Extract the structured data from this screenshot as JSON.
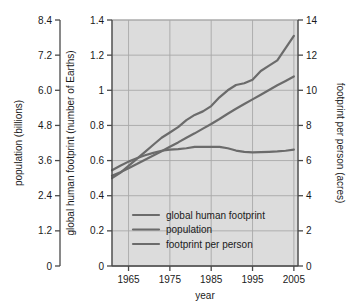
{
  "chart_data": {
    "type": "line",
    "title": "",
    "xlabel": "year",
    "x": [
      1961,
      1963,
      1965,
      1967,
      1969,
      1971,
      1973,
      1975,
      1977,
      1979,
      1981,
      1983,
      1985,
      1987,
      1989,
      1991,
      1993,
      1995,
      1997,
      1999,
      2001,
      2003,
      2005
    ],
    "xlim": [
      1961,
      2006
    ],
    "xticks": [
      1965,
      1975,
      1985,
      1995,
      2005
    ],
    "xtick_labels": [
      "1965",
      "1975",
      "1985",
      "1995",
      "2005"
    ],
    "grid": true,
    "legend_position": "bottom-center-inside",
    "axes": [
      {
        "id": "left",
        "label": "population (billions)",
        "lim": [
          0,
          8.4
        ],
        "ticks": [
          0,
          1.2,
          2.4,
          3.6,
          4.8,
          6.0,
          7.2,
          8.4
        ],
        "tick_labels": [
          "0",
          "1.2",
          "2.4",
          "3.6",
          "4.8",
          "6.0",
          "7.2",
          "8.4"
        ]
      },
      {
        "id": "inner-left",
        "label": "global human footprint (number of Earths)",
        "lim": [
          0,
          1.4
        ],
        "ticks": [
          0,
          0.2,
          0.4,
          0.6,
          0.8,
          1.0,
          1.2,
          1.4
        ],
        "tick_labels": [
          "0",
          "0.2",
          "0.4",
          "0.6",
          "0.8",
          "1",
          "1.2",
          "1.4"
        ]
      },
      {
        "id": "right",
        "label": "footprint per person (acres)",
        "lim": [
          0,
          14
        ],
        "ticks": [
          0,
          2,
          4,
          6,
          8,
          10,
          12,
          14
        ],
        "tick_labels": [
          "0",
          "2",
          "4",
          "6",
          "8",
          "10",
          "12",
          "14"
        ]
      }
    ],
    "series": [
      {
        "name": "global human footprint",
        "axis": "inner-left",
        "unit": "number of Earths",
        "color": "#6b6b6b",
        "values": [
          0.5,
          0.53,
          0.57,
          0.61,
          0.65,
          0.69,
          0.73,
          0.76,
          0.79,
          0.83,
          0.86,
          0.88,
          0.91,
          0.96,
          1.0,
          1.03,
          1.04,
          1.06,
          1.11,
          1.14,
          1.17,
          1.24,
          1.31
        ]
      },
      {
        "name": "population",
        "axis": "left",
        "unit": "billions",
        "color": "#6b6b6b",
        "values": [
          3.08,
          3.2,
          3.34,
          3.48,
          3.63,
          3.77,
          3.92,
          4.07,
          4.22,
          4.38,
          4.53,
          4.69,
          4.85,
          5.02,
          5.2,
          5.37,
          5.53,
          5.69,
          5.85,
          6.01,
          6.17,
          6.32,
          6.47
        ]
      },
      {
        "name": "footprint per person",
        "axis": "right",
        "unit": "acres",
        "color": "#6b6b6b",
        "values": [
          5.45,
          5.7,
          5.94,
          6.13,
          6.3,
          6.44,
          6.56,
          6.62,
          6.65,
          6.7,
          6.78,
          6.78,
          6.78,
          6.78,
          6.7,
          6.57,
          6.5,
          6.47,
          6.48,
          6.5,
          6.52,
          6.56,
          6.62
        ]
      }
    ]
  },
  "legend": {
    "items": [
      {
        "label": "global human footprint"
      },
      {
        "label": "population"
      },
      {
        "label": "footprint per person"
      }
    ]
  },
  "colors": {
    "plot_background": "#dcdcdc",
    "gridline": "#a8a8a8",
    "axis": "#4a4a4a",
    "line": "#6b6b6b",
    "text": "#1a1a1a"
  }
}
